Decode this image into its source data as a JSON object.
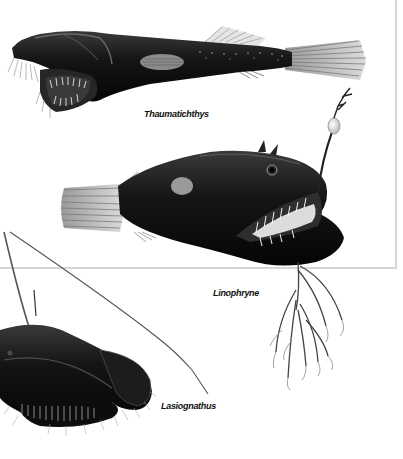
{
  "illustration": {
    "background": "#ffffff",
    "frame_color": "#d6d6d6",
    "fish_color": "#141414",
    "fin_color": "#bdbdbd"
  },
  "figures": [
    {
      "name": "Thaumatichthys",
      "caption": "Thaumatichthys"
    },
    {
      "name": "Linophryne",
      "caption": "Linophryne"
    },
    {
      "name": "Lasiognathus",
      "caption": "Lasiognathus"
    }
  ]
}
